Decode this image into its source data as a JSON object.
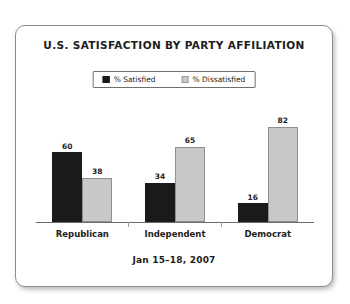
{
  "card": {
    "title": "U.S. SATISFACTION BY PARTY AFFILIATION",
    "footnote": "Jan 15–18, 2007"
  },
  "top_remnant": "",
  "legend": {
    "items": [
      {
        "label": "% Satisfied",
        "icon": "legend-swatch-dark",
        "color": "#1a1a1a"
      },
      {
        "label": "% Dissatisfied",
        "icon": "legend-swatch-light",
        "color": "#c8c8c8"
      }
    ]
  },
  "chart_data": {
    "type": "bar",
    "title": "U.S. SATISFACTION BY PARTY AFFILIATION",
    "subtitle": "Jan 15–18, 2007",
    "xlabel": "",
    "ylabel": "",
    "ylim": [
      0,
      100
    ],
    "grid": false,
    "legend_position": "top-center",
    "categories": [
      "Republican",
      "Independent",
      "Democrat"
    ],
    "series": [
      {
        "name": "% Satisfied",
        "color": "#1a1a1a",
        "values": [
          60,
          34,
          16
        ]
      },
      {
        "name": "% Dissatisfied",
        "color": "#c8c8c8",
        "values": [
          38,
          65,
          82
        ]
      }
    ],
    "data_labels": [
      {
        "category": "Republican",
        "satisfied": 60,
        "dissatisfied": 38
      },
      {
        "category": "Independent",
        "satisfied": 34,
        "dissatisfied": 65
      },
      {
        "category": "Democrat",
        "satisfied": 16,
        "dissatisfied": 82
      }
    ]
  },
  "colors": {
    "satisfied": "#1a1a1a",
    "dissatisfied": "#c8c8c8",
    "card_border": "#8d8d8d",
    "axis": "#6a6a6a",
    "text": "#1d1d1d",
    "background": "#ffffff"
  }
}
